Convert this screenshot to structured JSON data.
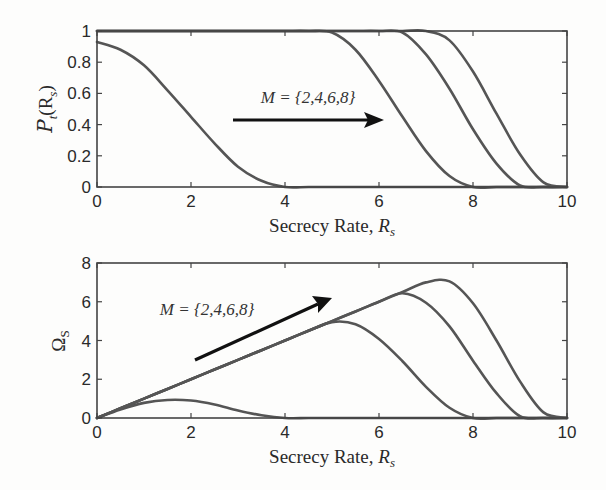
{
  "chart_data": [
    {
      "type": "line",
      "title": "",
      "xlabel": "Secrecy Rate, R_s",
      "ylabel": "P_t(R_s)",
      "xlim": [
        0,
        10
      ],
      "ylim": [
        0,
        1
      ],
      "xticks": [
        "0",
        "2",
        "4",
        "6",
        "8",
        "10"
      ],
      "yticks": [
        "0",
        "0.2",
        "0.4",
        "0.6",
        "0.8",
        "1"
      ],
      "grid": false,
      "annotation": {
        "text": "M = {2,4,6,8}",
        "arrow": "horizontal, pointing right (increasing M)"
      },
      "x": [
        0,
        0.5,
        1,
        1.5,
        2,
        2.5,
        3,
        3.5,
        4,
        4.5,
        5,
        5.5,
        6,
        6.5,
        7,
        7.5,
        8,
        8.5,
        9,
        9.5,
        10
      ],
      "series": [
        {
          "name": "M=2",
          "values": [
            0.93,
            0.88,
            0.78,
            0.62,
            0.45,
            0.28,
            0.13,
            0.04,
            0,
            0,
            0,
            0,
            0,
            0,
            0,
            0,
            0,
            0,
            0,
            0,
            0
          ]
        },
        {
          "name": "M=4",
          "values": [
            1,
            1,
            1,
            1,
            1,
            1,
            1,
            1,
            1,
            1,
            0.99,
            0.88,
            0.68,
            0.45,
            0.23,
            0.07,
            0,
            0,
            0,
            0,
            0
          ]
        },
        {
          "name": "M=6",
          "values": [
            1,
            1,
            1,
            1,
            1,
            1,
            1,
            1,
            1,
            1,
            1,
            1,
            1,
            0.99,
            0.85,
            0.63,
            0.37,
            0.15,
            0.01,
            0,
            0
          ]
        },
        {
          "name": "M=8",
          "values": [
            1,
            1,
            1,
            1,
            1,
            1,
            1,
            1,
            1,
            1,
            1,
            1,
            1,
            1,
            1,
            0.94,
            0.74,
            0.47,
            0.21,
            0.03,
            0
          ]
        }
      ]
    },
    {
      "type": "line",
      "title": "",
      "xlabel": "Secrecy Rate, R_s",
      "ylabel": "Ω_S",
      "xlim": [
        0,
        10
      ],
      "ylim": [
        0,
        8
      ],
      "xticks": [
        "0",
        "2",
        "4",
        "6",
        "8",
        "10"
      ],
      "yticks": [
        "0",
        "2",
        "4",
        "6",
        "8"
      ],
      "grid": false,
      "annotation": {
        "text": "M = {2,4,6,8}",
        "arrow": "diagonal, pointing up-right (increasing M)"
      },
      "x": [
        0,
        0.5,
        1,
        1.5,
        2,
        2.5,
        3,
        3.5,
        4,
        4.5,
        5,
        5.5,
        6,
        6.5,
        7,
        7.5,
        8,
        8.5,
        9,
        9.5,
        10
      ],
      "series": [
        {
          "name": "M=2",
          "values": [
            0,
            0.44,
            0.78,
            0.93,
            0.9,
            0.7,
            0.39,
            0.14,
            0,
            0,
            0,
            0,
            0,
            0,
            0,
            0,
            0,
            0,
            0,
            0,
            0
          ]
        },
        {
          "name": "M=4",
          "values": [
            0,
            0.5,
            1,
            1.5,
            2,
            2.5,
            3,
            3.5,
            4,
            4.5,
            4.95,
            4.84,
            4.08,
            2.93,
            1.61,
            0.53,
            0,
            0,
            0,
            0,
            0
          ]
        },
        {
          "name": "M=6",
          "values": [
            0,
            0.5,
            1,
            1.5,
            2,
            2.5,
            3,
            3.5,
            4,
            4.5,
            5,
            5.5,
            6,
            6.44,
            5.95,
            4.73,
            2.96,
            1.28,
            0.09,
            0,
            0
          ]
        },
        {
          "name": "M=8",
          "values": [
            0,
            0.5,
            1,
            1.5,
            2,
            2.5,
            3,
            3.5,
            4,
            4.5,
            5,
            5.5,
            6,
            6.5,
            7,
            7.05,
            5.92,
            4.0,
            1.89,
            0.29,
            0
          ]
        }
      ]
    }
  ],
  "plots": {
    "top": {
      "ylabel_main": "P",
      "ylabel_sub": "t",
      "ylabel_arg": "(R",
      "ylabel_arg_sub": "s",
      "ylabel_close": ")",
      "xlabel_main": "Secrecy Rate, ",
      "xlabel_var": "R",
      "xlabel_sub": "s",
      "annotation": "M = {2,4,6,8}"
    },
    "bottom": {
      "ylabel_main": "Ω",
      "ylabel_sub": "S",
      "xlabel_main": "Secrecy Rate, ",
      "xlabel_var": "R",
      "xlabel_sub": "s",
      "annotation": "M = {2,4,6,8}"
    }
  }
}
